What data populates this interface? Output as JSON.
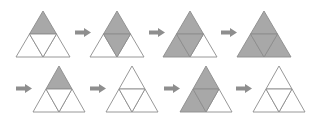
{
  "diagram": {
    "colors": {
      "background": "#ffffff",
      "fill": "#a8a8a8",
      "stroke": "#8c8c8c",
      "empty": "#ffffff",
      "arrow": "#8e8e8e"
    },
    "rows": [
      {
        "triangles": [
          {
            "id": "r1t1",
            "cx": 43,
            "top": 11,
            "w": 54,
            "h": 46,
            "filled": {
              "top": true,
              "bl": false,
              "center": false,
              "br": false
            }
          },
          {
            "id": "r1t2",
            "cx": 117,
            "top": 11,
            "w": 54,
            "h": 46,
            "filled": {
              "top": true,
              "bl": false,
              "center": true,
              "br": false
            }
          },
          {
            "id": "r1t3",
            "cx": 190,
            "top": 11,
            "w": 54,
            "h": 46,
            "filled": {
              "top": true,
              "bl": true,
              "center": true,
              "br": false
            }
          },
          {
            "id": "r1t4",
            "cx": 264,
            "top": 11,
            "w": 54,
            "h": 46,
            "filled": {
              "top": true,
              "bl": true,
              "center": true,
              "br": true
            }
          }
        ],
        "arrows": [
          {
            "id": "r1a1",
            "x": 75,
            "y": 28
          },
          {
            "id": "r1a2",
            "x": 149,
            "y": 28
          },
          {
            "id": "r1a3",
            "x": 221,
            "y": 28
          }
        ]
      },
      {
        "triangles": [
          {
            "id": "r2t1",
            "cx": 59,
            "top": 66,
            "w": 52,
            "h": 46,
            "filled": {
              "top": true,
              "bl": false,
              "center": false,
              "br": false
            }
          },
          {
            "id": "r2t2",
            "cx": 132,
            "top": 66,
            "w": 52,
            "h": 46,
            "filled": {
              "top": false,
              "bl": false,
              "center": false,
              "br": false
            }
          },
          {
            "id": "r2t3",
            "cx": 206,
            "top": 66,
            "w": 52,
            "h": 46,
            "filled": {
              "top": true,
              "bl": true,
              "center": true,
              "br": false
            }
          },
          {
            "id": "r2t4",
            "cx": 279,
            "top": 66,
            "w": 52,
            "h": 46,
            "filled": {
              "top": false,
              "bl": false,
              "center": false,
              "br": false
            }
          }
        ],
        "arrows": [
          {
            "id": "r2a1",
            "x": 16,
            "y": 84
          },
          {
            "id": "r2a2",
            "x": 90,
            "y": 84
          },
          {
            "id": "r2a3",
            "x": 164,
            "y": 84
          },
          {
            "id": "r2a4",
            "x": 236,
            "y": 84
          }
        ]
      }
    ]
  }
}
